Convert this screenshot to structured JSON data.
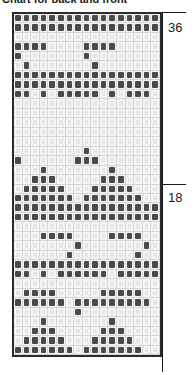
{
  "title": "Chart for back and front",
  "labels": {
    "top": "36",
    "middle": "18"
  },
  "colors": {
    "dark": "#4a4a4a",
    "light": "#e6e6e6",
    "grid": "#d6d6d6",
    "border": "#2a2a2a"
  },
  "grid": {
    "columns": 17,
    "rows": 36,
    "cells": [
      "XXXXXXXXXXXXXXXXX",
      "XXXXXXXXXXXXXXXXX",
      ".................",
      "XXXX....XXXX.....",
      "X.......X........",
      ".X.......X.......",
      "XXXXXXXXXXXXXXXXX",
      "XXXXXXXXXXXXXXXXX",
      "XX.X.XXXXX.X.XXX.",
      ".................",
      ".................",
      ".................",
      ".................",
      ".................",
      "........X........",
      "X......XXX.......",
      "...X.......X.....",
      "..XXX.....XXX....",
      ".XXXXX...XXXXX...",
      "XXXXXXX.XXXXXXX..",
      "XXXXXXXXXXXXXXXXX",
      "XXXXXXXXXXXXXXXXX",
      ".................",
      "...XXXX....XXXX..",
      ".......X.......X.",
      "......X.......X..",
      "XXXXXXXXXXXXXXXXX",
      "XX.X.XXXXXX.XXXXX",
      ".................",
      ".XXXX.....XXXXX..",
      "XXXXXX.XXXXXXXXX.",
      ".......X.........",
      "...X.......X.....",
      "..XXX.....XXX....",
      ".XXXXX...XXXXX...",
      "XXXXXXX.XXXXXXX.."
    ]
  }
}
